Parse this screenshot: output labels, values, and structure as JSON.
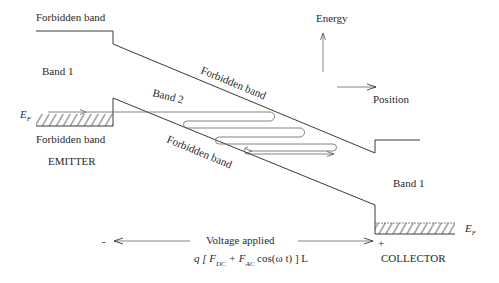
{
  "labels": {
    "forbidden_top_left": "Forbidden band",
    "band1_left": "Band 1",
    "band2": "Band 2",
    "forbidden_upper_diag": "Forbidden band",
    "forbidden_lower_diag": "Forbidden band",
    "forbidden_bottom_left": "Forbidden band",
    "emitter": "EMITTER",
    "band1_right": "Band 1",
    "collector": "COLLECTOR",
    "fermi_left": "E",
    "fermi_left_sub": "F",
    "fermi_right": "E",
    "fermi_right_sub": "F",
    "energy_axis": "Energy",
    "position_axis": "Position",
    "voltage_label": "Voltage applied",
    "minus_sign": "-",
    "plus_sign": "+",
    "formula": {
      "q_open": "q [ F",
      "sub_dc": "DC",
      "plus_f": " + F",
      "sub_ac": "AC",
      "rest": " cos(ω t) ] L"
    }
  },
  "colors": {
    "line": "#3a3a3a",
    "text": "#2a2a2a",
    "background": "#ffffff"
  }
}
